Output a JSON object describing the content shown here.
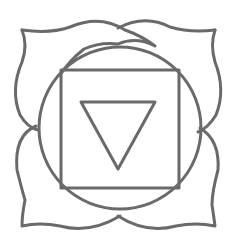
{
  "diagram": {
    "title": "",
    "stroke_color": "#6a6a6a",
    "background": "#ffffff",
    "elements": [
      "four-petals",
      "circle",
      "square",
      "downward-triangle"
    ]
  }
}
